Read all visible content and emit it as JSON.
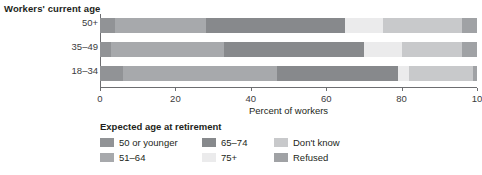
{
  "chart_title": "Workers' current age",
  "axis": {
    "xlabel": "Percent of workers",
    "xticks": [
      "0",
      "20",
      "40",
      "60",
      "80",
      "10"
    ],
    "xtick_values": [
      0,
      20,
      40,
      60,
      80,
      100
    ],
    "xlim": [
      0,
      100
    ],
    "ycategories": [
      "50+",
      "35–49",
      "18–34"
    ]
  },
  "legend": {
    "title": "Expected age at retirement",
    "items": [
      {
        "label": "50 or younger",
        "color": "#919396"
      },
      {
        "label": "51–64",
        "color": "#a7a9ac"
      },
      {
        "label": "65–74",
        "color": "#87898c"
      },
      {
        "label": "75+",
        "color": "#ebebec"
      },
      {
        "label": "Don't know",
        "color": "#c8c9cb"
      },
      {
        "label": "Refused",
        "color": "#a0a2a5"
      }
    ]
  },
  "chart_data": {
    "type": "bar",
    "orientation": "horizontal",
    "stacked": true,
    "title": "Workers' current age",
    "xlabel": "Percent of workers",
    "ylabel": "Workers' current age",
    "xlim": [
      0,
      100
    ],
    "grid": false,
    "legend_position": "bottom",
    "legend_title": "Expected age at retirement",
    "categories": [
      "50+",
      "35–49",
      "18–34"
    ],
    "series": [
      {
        "name": "50 or younger",
        "color": "#919396",
        "values": [
          4,
          3,
          6
        ]
      },
      {
        "name": "51–64",
        "color": "#a7a9ac",
        "values": [
          24,
          30,
          41
        ]
      },
      {
        "name": "65–74",
        "color": "#87898c",
        "values": [
          37,
          37,
          32
        ]
      },
      {
        "name": "75+",
        "color": "#ebebec",
        "values": [
          10,
          10,
          3
        ]
      },
      {
        "name": "Don't know",
        "color": "#c8c9cb",
        "values": [
          21,
          16,
          17
        ]
      },
      {
        "name": "Refused",
        "color": "#a0a2a5",
        "values": [
          4,
          4,
          1
        ]
      }
    ],
    "cumulative_boundaries": {
      "50+": [
        4,
        28,
        65,
        75,
        96,
        100
      ],
      "35–49": [
        3,
        33,
        70,
        80,
        96,
        100
      ],
      "18–34": [
        6,
        47,
        79,
        82,
        99,
        100
      ]
    }
  }
}
